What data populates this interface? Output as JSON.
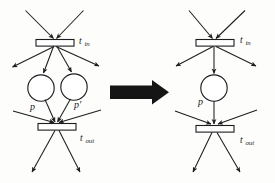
{
  "figure": {
    "background_color": "#fdfdfc",
    "ink_color": "#1d1d1d",
    "arrow_color": "#151515"
  },
  "left_net": {
    "name": "before",
    "transitions": [
      {
        "id": "t_in",
        "label_base": "t",
        "label_sub": "in",
        "x": 50,
        "y": 41
      },
      {
        "id": "t_out",
        "label_base": "t",
        "label_sub": "out",
        "x": 56,
        "y": 127
      }
    ],
    "places": [
      {
        "id": "p",
        "label": "p",
        "cx": 41,
        "cy": 88,
        "r": 13
      },
      {
        "id": "p2",
        "label": "p'",
        "cx": 74,
        "cy": 87,
        "r": 13
      }
    ],
    "labels": {
      "t_in": "t",
      "t_in_sub": "in",
      "t_out": "t",
      "t_out_sub": "out",
      "place_p": "p",
      "place_p_prime": "p'"
    }
  },
  "right_net": {
    "name": "after",
    "transitions": [
      {
        "id": "t_in",
        "label_base": "t",
        "label_sub": "in",
        "x": 215,
        "y": 41
      },
      {
        "id": "t_out",
        "label_base": "t",
        "label_sub": "out",
        "x": 218,
        "y": 129
      }
    ],
    "places": [
      {
        "id": "p",
        "label": "p",
        "cx": 214,
        "cy": 88,
        "r": 13
      }
    ],
    "labels": {
      "t_in": "t",
      "t_in_sub": "in",
      "t_out": "t",
      "t_out_sub": "out",
      "place_p": "p"
    }
  },
  "transform_arrow": {
    "name": "transformation-arrow",
    "direction": "right",
    "color": "#151515"
  }
}
